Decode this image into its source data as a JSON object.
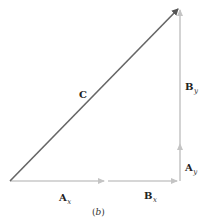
{
  "diagram": {
    "type": "vector-addition",
    "caption": {
      "open": "(",
      "letter": "b",
      "close": ")"
    },
    "colors": {
      "resultant": "#666666",
      "components": "#c4c4c4",
      "text": "#222222"
    },
    "vectors": [
      {
        "id": "C",
        "label": "C",
        "subscript": "",
        "from": [
          10,
          181
        ],
        "to": [
          180,
          7
        ]
      },
      {
        "id": "Ax",
        "label": "A",
        "subscript": "x",
        "from": [
          10,
          181
        ],
        "to": [
          106,
          181
        ]
      },
      {
        "id": "Bx",
        "label": "B",
        "subscript": "x",
        "from": [
          108,
          181
        ],
        "to": [
          179,
          181
        ]
      },
      {
        "id": "Ay",
        "label": "A",
        "subscript": "y",
        "from": [
          180,
          181
        ],
        "to": [
          180,
          142
        ]
      },
      {
        "id": "By",
        "label": "B",
        "subscript": "y",
        "from": [
          180,
          144
        ],
        "to": [
          180,
          7
        ]
      }
    ],
    "labels": {
      "C": {
        "main": "C",
        "sub": ""
      },
      "By": {
        "main": "B",
        "sub": "y"
      },
      "Ay": {
        "main": "A",
        "sub": "y"
      },
      "Ax": {
        "main": "A",
        "sub": "x"
      },
      "Bx": {
        "main": "B",
        "sub": "x"
      }
    }
  }
}
